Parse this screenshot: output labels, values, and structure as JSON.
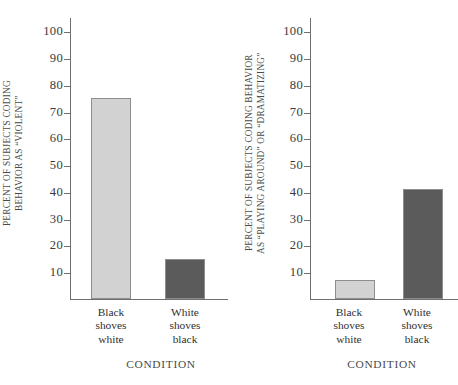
{
  "chart_data": [
    {
      "type": "bar",
      "panel": "left",
      "title": "",
      "ylabel": "PERCENT OF SUBJECTS CODING\nBEHAVIOR AS “VIOLENT”",
      "xlabel": "CONDITION",
      "categories": [
        "Black\nshoves\nwhite",
        "White\nshoves\nblack"
      ],
      "values": [
        75,
        15
      ],
      "bar_colors": [
        "#d2d2d2",
        "#5b5b5b"
      ],
      "ylim": [
        0,
        105
      ],
      "yticks": [
        10,
        20,
        30,
        40,
        50,
        60,
        70,
        80,
        90,
        100
      ],
      "ytick_labels": [
        "10",
        "20",
        "30",
        "40",
        "50",
        "60",
        "70",
        "80",
        "90",
        "100"
      ],
      "grid": false,
      "legend": "none"
    },
    {
      "type": "bar",
      "panel": "right",
      "title": "",
      "ylabel": "PERCENT OF SUBJECTS CODING BEHAVIOR\nAS “PLAYING AROUND” OR “DRAMATIZING”",
      "xlabel": "CONDITION",
      "categories": [
        "Black\nshoves\nwhite",
        "White\nshoves\nblack"
      ],
      "values": [
        7,
        41
      ],
      "bar_colors": [
        "#d2d2d2",
        "#5b5b5b"
      ],
      "ylim": [
        0,
        105
      ],
      "yticks": [
        10,
        20,
        30,
        40,
        50,
        60,
        70,
        80,
        90,
        100
      ],
      "ytick_labels": [
        "10",
        "20",
        "30",
        "40",
        "50",
        "60",
        "70",
        "80",
        "90",
        "100"
      ],
      "grid": false,
      "legend": "none"
    }
  ],
  "colors": {
    "light_bar": "#d2d2d2",
    "dark_bar": "#5b5b5b",
    "axis": "#6f6f6f",
    "text": "#2f2f2f",
    "background": "#ffffff"
  }
}
